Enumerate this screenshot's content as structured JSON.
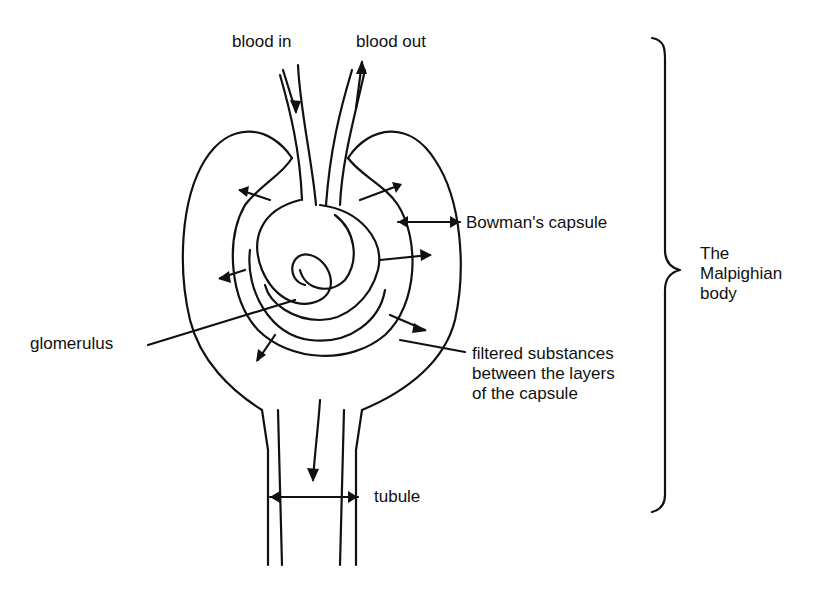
{
  "labels": {
    "blood_in": "blood in",
    "blood_out": "blood out",
    "bowmans_capsule": "Bowman's capsule",
    "glomerulus": "glomerulus",
    "filtered_line1": "filtered substances",
    "filtered_line2": "between the layers",
    "filtered_line3": "of the capsule",
    "tubule": "tubule",
    "malpighian_line1": "The",
    "malpighian_line2": "Malpighian",
    "malpighian_line3": "body"
  }
}
